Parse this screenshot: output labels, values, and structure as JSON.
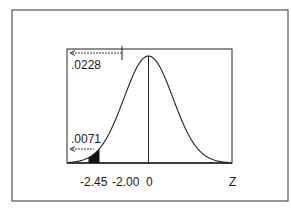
{
  "chart_data": {
    "type": "area",
    "title": "",
    "xlabel": "Z",
    "ylabel": "",
    "distribution": "standard normal",
    "x_ticks": [
      "-2.45",
      "-2.00",
      "0"
    ],
    "x_tick_values": [
      -2.45,
      -2.0,
      0
    ],
    "shaded_region": {
      "from": -2.45,
      "to": -2.0
    },
    "annotations": [
      {
        "text": ".0228",
        "meaning": "area to the left of z = -2.00",
        "arrow": "left"
      },
      {
        "text": ".0071",
        "meaning": "area to the left of z = -2.45",
        "arrow": "left"
      }
    ],
    "mean_line": 0,
    "grid": false,
    "legend": null
  },
  "labels": {
    "area_upper": ".0228",
    "area_lower": ".0071",
    "tick_a": "-2.45",
    "tick_b": "-2.00",
    "tick_c": "0",
    "axis_var": "Z"
  },
  "colors": {
    "ink": "#1a1a1a",
    "shade": "#111111",
    "background": "#ffffff"
  }
}
